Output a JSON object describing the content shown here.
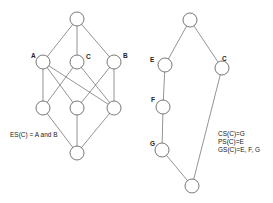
{
  "left_graph": {
    "labels": {
      "A": "A",
      "C": "C",
      "B": "B"
    },
    "caption": "ES(C) = A and B"
  },
  "right_graph": {
    "labels": {
      "E": "E",
      "C": "C",
      "F": "F",
      "G": "G"
    },
    "annotations": [
      "CS(C)=G",
      "PS(C)=E",
      "GS(C)=E, F, G"
    ]
  },
  "colors": {
    "stroke": "#555555",
    "text": "#222222"
  }
}
